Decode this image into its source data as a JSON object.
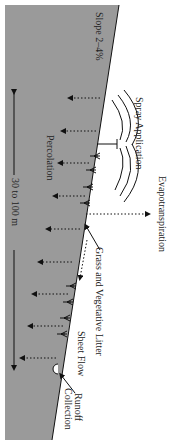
{
  "diagram": {
    "orientation": "rotated 90 degrees clockwise",
    "colors": {
      "soil": "#9a9a9a",
      "background": "#ffffff",
      "lines": "#111111"
    },
    "labels": {
      "slope": "Slope 2–4%",
      "spray": "Spray Application",
      "percolation": "Percolation",
      "evapotranspiration": "Evapotranspiration",
      "distance": "30 to 100 m",
      "grass": "Grass and Vegetative Litter",
      "sheet_flow": "Sheet Flow",
      "runoff_1": "Runoff",
      "runoff_2": "Collection"
    }
  }
}
